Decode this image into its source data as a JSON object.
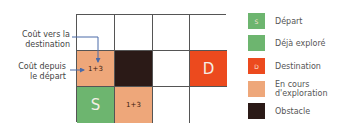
{
  "colors": {
    "start": "#6db56f",
    "explored": "#6db56f",
    "destination": "#ec4a1e",
    "exploring": "#eea77a",
    "obstacle": "#2b1a17",
    "empty": "#ffffff",
    "arrow": "#4a6aa8"
  },
  "grid": {
    "rows": 3,
    "cols": 4,
    "cells": [
      {
        "row": 0,
        "col": 0,
        "type": "empty",
        "text": ""
      },
      {
        "row": 0,
        "col": 1,
        "type": "empty",
        "text": ""
      },
      {
        "row": 0,
        "col": 2,
        "type": "empty",
        "text": ""
      },
      {
        "row": 0,
        "col": 3,
        "type": "empty",
        "text": ""
      },
      {
        "row": 1,
        "col": 0,
        "type": "exploring",
        "text": "1+3"
      },
      {
        "row": 1,
        "col": 1,
        "type": "obstacle",
        "text": ""
      },
      {
        "row": 1,
        "col": 2,
        "type": "empty",
        "text": ""
      },
      {
        "row": 1,
        "col": 3,
        "type": "destination",
        "text": "D"
      },
      {
        "row": 2,
        "col": 0,
        "type": "start",
        "text": "S"
      },
      {
        "row": 2,
        "col": 1,
        "type": "exploring",
        "text": "1+3"
      },
      {
        "row": 2,
        "col": 2,
        "type": "empty",
        "text": ""
      },
      {
        "row": 2,
        "col": 3,
        "type": "empty",
        "text": ""
      }
    ]
  },
  "annotations": {
    "cost_to_destination": "Coût vers la destination",
    "cost_to_destination_l1": "Coût vers la",
    "cost_to_destination_l2": "destination",
    "cost_from_start_l1": "Coût depuis",
    "cost_from_start_l2": "le départ"
  },
  "legend": [
    {
      "key": "start",
      "swatch_text": "S",
      "label": "Départ"
    },
    {
      "key": "explored",
      "swatch_text": "",
      "label": "Déjà exploré"
    },
    {
      "key": "destination",
      "swatch_text": "D",
      "label": "Destination"
    },
    {
      "key": "exploring",
      "swatch_text": "",
      "label": "En cours d'exploration",
      "label_l1": "En cours",
      "label_l2": "d'exploration"
    },
    {
      "key": "obstacle",
      "swatch_text": "",
      "label": "Obstacle"
    }
  ]
}
